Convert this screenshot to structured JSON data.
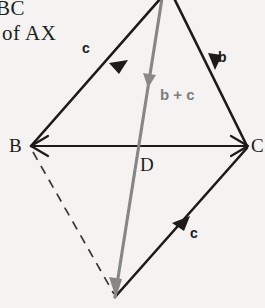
{
  "figure": {
    "background_color": "#f4f3f1",
    "ink_color": "#1d1b1a",
    "accent_color": "#7e7e7e",
    "caption_line_1": "BC",
    "caption_line_2": "of AX"
  },
  "vertices": {
    "b_label": "B",
    "c_label": "C",
    "d_label": "D"
  },
  "vectors": {
    "upper_left_label": "c",
    "upper_right_label": "b",
    "lower_right_label": "c",
    "resultant_label": "b + c"
  }
}
